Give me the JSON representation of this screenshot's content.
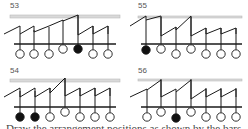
{
  "colors": {
    "line": "#1a1a1a",
    "bar": "#d9d9d9",
    "bar_stroke": "#bbbbbb",
    "filled": "#111111",
    "empty": "#ffffff",
    "label": "#555555"
  },
  "panels": [
    {
      "label": "53",
      "x": 0,
      "y": 0,
      "label_pos": [
        10,
        7
      ],
      "bar": [
        10,
        15,
        110,
        3
      ],
      "baseline": [
        14,
        44,
        116,
        44
      ],
      "pegs": [
        {
          "x": 20,
          "top": 34,
          "cy": 54,
          "filled": false
        },
        {
          "x": 34,
          "top": 30,
          "cy": 54,
          "filled": false
        },
        {
          "x": 49,
          "top": 27,
          "cy": 54,
          "filled": false
        },
        {
          "x": 63,
          "top": 20,
          "cy": 49,
          "filled": false
        },
        {
          "x": 78,
          "top": 15,
          "cy": 49,
          "filled": true
        },
        {
          "x": 93,
          "top": 26,
          "cy": 54,
          "filled": false
        },
        {
          "x": 108,
          "top": 26,
          "cy": 54,
          "filled": false
        }
      ],
      "zigzag": [
        [
          4,
          34
        ],
        [
          20,
          26
        ],
        [
          20,
          34
        ],
        [
          34,
          26
        ],
        [
          34,
          32
        ],
        [
          49,
          26
        ],
        [
          63,
          20
        ],
        [
          63,
          21
        ],
        [
          78,
          15
        ],
        [
          78,
          35
        ],
        [
          93,
          26
        ],
        [
          93,
          34
        ],
        [
          108,
          26
        ],
        [
          108,
          34
        ]
      ]
    },
    {
      "label": "55",
      "x": 124,
      "y": 0,
      "label_pos": [
        14,
        7
      ],
      "bar": [
        14,
        16,
        104,
        2
      ],
      "baseline": [
        17,
        44,
        118,
        44
      ],
      "pegs": [
        {
          "x": 22,
          "top": 20,
          "cy": 50,
          "filled": true
        },
        {
          "x": 37,
          "top": 17,
          "cy": 49,
          "filled": false
        },
        {
          "x": 52,
          "top": 27,
          "cy": 54,
          "filled": false
        },
        {
          "x": 67,
          "top": 17,
          "cy": 49,
          "filled": false
        },
        {
          "x": 82,
          "top": 28,
          "cy": 54,
          "filled": false
        },
        {
          "x": 97,
          "top": 28,
          "cy": 54,
          "filled": false
        },
        {
          "x": 112,
          "top": 28,
          "cy": 54,
          "filled": false
        }
      ],
      "zigzag": [
        [
          6,
          26
        ],
        [
          22,
          16
        ],
        [
          22,
          20
        ],
        [
          37,
          16
        ],
        [
          37,
          36
        ],
        [
          52,
          27
        ],
        [
          52,
          30
        ],
        [
          67,
          16
        ],
        [
          67,
          36
        ],
        [
          82,
          28
        ],
        [
          82,
          34
        ],
        [
          97,
          28
        ],
        [
          97,
          34
        ],
        [
          112,
          28
        ],
        [
          112,
          34
        ]
      ]
    },
    {
      "label": "54",
      "x": 0,
      "y": 60,
      "label_pos": [
        10,
        12
      ],
      "bar": [
        10,
        19,
        110,
        3
      ],
      "baseline": [
        14,
        47,
        116,
        47
      ],
      "pegs": [
        {
          "x": 20,
          "top": 31,
          "cy": 57,
          "filled": true
        },
        {
          "x": 35,
          "top": 31,
          "cy": 57,
          "filled": true
        },
        {
          "x": 50,
          "top": 28,
          "cy": 57,
          "filled": false
        },
        {
          "x": 65,
          "top": 18,
          "cy": 52,
          "filled": false
        },
        {
          "x": 80,
          "top": 28,
          "cy": 57,
          "filled": false
        },
        {
          "x": 95,
          "top": 28,
          "cy": 57,
          "filled": false
        },
        {
          "x": 110,
          "top": 28,
          "cy": 57,
          "filled": false
        }
      ],
      "zigzag": [
        [
          4,
          37
        ],
        [
          20,
          28
        ],
        [
          20,
          37
        ],
        [
          35,
          28
        ],
        [
          35,
          37
        ],
        [
          50,
          28
        ],
        [
          50,
          33
        ],
        [
          65,
          18
        ],
        [
          65,
          36
        ],
        [
          80,
          28
        ],
        [
          80,
          36
        ],
        [
          95,
          28
        ],
        [
          95,
          36
        ],
        [
          110,
          28
        ],
        [
          110,
          36
        ]
      ]
    },
    {
      "label": "56",
      "x": 124,
      "y": 60,
      "label_pos": [
        14,
        12
      ],
      "bar": [
        14,
        19,
        104,
        2
      ],
      "baseline": [
        17,
        47,
        118,
        47
      ],
      "pegs": [
        {
          "x": 23,
          "top": 30,
          "cy": 57,
          "filled": false
        },
        {
          "x": 37,
          "top": 19,
          "cy": 52,
          "filled": false
        },
        {
          "x": 52,
          "top": 32,
          "cy": 58,
          "filled": true
        },
        {
          "x": 67,
          "top": 19,
          "cy": 52,
          "filled": false
        },
        {
          "x": 82,
          "top": 28,
          "cy": 57,
          "filled": false
        },
        {
          "x": 97,
          "top": 28,
          "cy": 57,
          "filled": false
        },
        {
          "x": 112,
          "top": 28,
          "cy": 57,
          "filled": false
        }
      ],
      "zigzag": [
        [
          6,
          37
        ],
        [
          23,
          29
        ],
        [
          23,
          30
        ],
        [
          37,
          20
        ],
        [
          37,
          37
        ],
        [
          52,
          29
        ],
        [
          52,
          32
        ],
        [
          67,
          20
        ],
        [
          67,
          39
        ],
        [
          82,
          29
        ],
        [
          82,
          37
        ],
        [
          97,
          29
        ],
        [
          97,
          37
        ],
        [
          112,
          29
        ],
        [
          112,
          37
        ]
      ]
    }
  ],
  "caption": "Draw the arrangement positions as shown by the bars"
}
